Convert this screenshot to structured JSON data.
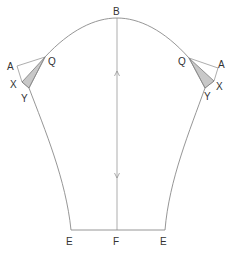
{
  "diagram": {
    "type": "sewing-pattern-sleeve",
    "colors": {
      "line": "#8a8a8a",
      "dart_fill": "#c8c8c8",
      "label": "#333333",
      "background": "#ffffff"
    },
    "labels": {
      "top": "B",
      "left_q": "Q",
      "left_a": "A",
      "left_x": "X",
      "left_y": "Y",
      "right_q": "Q",
      "right_a": "A",
      "right_x": "X",
      "right_y": "Y",
      "hem_left": "E",
      "hem_center": "F",
      "hem_right": "E"
    },
    "icons": [
      "grainline-arrow-up-icon",
      "grainline-arrow-down-icon"
    ]
  }
}
